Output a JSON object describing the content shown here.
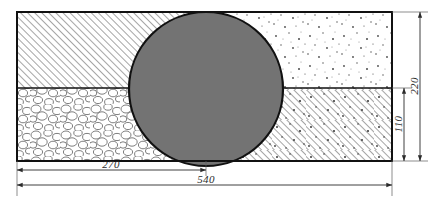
{
  "drawing": {
    "title": "pipe-bedding-cross-section",
    "canvas": {
      "width": 436,
      "height": 206,
      "background": "#ffffff"
    },
    "line_color": "#1a1a1a",
    "dimension_color": "#2b2b2b",
    "section_box": {
      "x": 17,
      "y": 12,
      "width": 375,
      "height": 149
    },
    "divider_y": 88,
    "divider_x_center": 206,
    "pipe": {
      "name": "pipe-circle",
      "cx": 206,
      "cy": 89,
      "r": 77,
      "fill": "#737373",
      "stroke": "#111111"
    },
    "quadrants": [
      {
        "name": "top-left-backfill",
        "pattern": "diagonal-hatch",
        "label": ""
      },
      {
        "name": "top-right-fill",
        "pattern": "stipple-dots",
        "label": ""
      },
      {
        "name": "bottom-left-gravel",
        "pattern": "cobble-gravel",
        "label": ""
      },
      {
        "name": "bottom-right-bed",
        "pattern": "hatch-and-stipple",
        "label": ""
      }
    ],
    "dimensions": [
      {
        "name": "dim-270",
        "value": "270",
        "orientation": "horizontal",
        "x1": 17,
        "x2": 206,
        "y": 170
      },
      {
        "name": "dim-540",
        "value": "540",
        "orientation": "horizontal",
        "x1": 17,
        "x2": 392,
        "y": 185
      },
      {
        "name": "dim-110",
        "value": "110",
        "orientation": "vertical",
        "y1": 88,
        "y2": 161,
        "x": 404
      },
      {
        "name": "dim-220",
        "value": "220",
        "orientation": "vertical",
        "y1": 12,
        "y2": 161,
        "x": 420
      }
    ]
  }
}
